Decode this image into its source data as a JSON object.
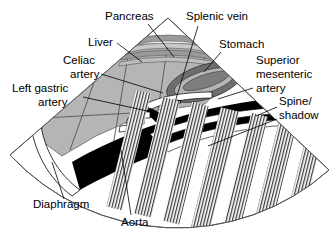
{
  "figure": {
    "kind": "anatomical-ultrasound-sector-diagram",
    "background_color": "#ffffff",
    "ink_color": "#000000",
    "palette": {
      "liver_gray": "#b5b5b5",
      "mid_gray": "#9a9a9a",
      "dark_gray": "#6e6e6e",
      "vessel_black": "#000000",
      "lumen_white": "#ffffff",
      "outline_gray": "#555555",
      "hatch_gray": "#3a3a3a"
    }
  },
  "labels": [
    {
      "id": "pancreas",
      "text": "Pancreas",
      "x": 105,
      "y": 20,
      "anchor": "start",
      "leader": "M148,24 L174,57"
    },
    {
      "id": "splenic-vein",
      "text": "Splenic vein",
      "x": 186,
      "y": 20,
      "anchor": "start",
      "leader": "M198,24 L174,101"
    },
    {
      "id": "liver",
      "text": "Liver",
      "x": 88,
      "y": 46,
      "anchor": "start",
      "leader": "M117,43 L140,62"
    },
    {
      "id": "stomach",
      "text": "Stomach",
      "x": 219,
      "y": 48,
      "anchor": "start",
      "leader": "M222,52 L203,72"
    },
    {
      "id": "celiac-artery",
      "text": "Celiac\nartery",
      "lines": [
        "Celiac",
        "artery"
      ],
      "x": 63,
      "y": 64,
      "anchor": "start",
      "leader": "M101,74 L162,92"
    },
    {
      "id": "superior-mesenteric-artery",
      "text": "Superior\nmesenteric\nartery",
      "lines": [
        "Superior",
        "mesenteric",
        "artery"
      ],
      "x": 256,
      "y": 64,
      "anchor": "start",
      "leader": "M254,88 L218,99"
    },
    {
      "id": "left-gastric-artery",
      "text": "Left gastric\nartery",
      "lines": [
        "Left gastric",
        "artery"
      ],
      "x": 12,
      "y": 92,
      "anchor": "start",
      "leader": "M83,97 L152,110"
    },
    {
      "id": "spine-shadow",
      "text": "Spine/\nshadow",
      "lines": [
        "Spine/",
        "shadow"
      ],
      "x": 279,
      "y": 105,
      "anchor": "start",
      "leader": "M277,108 L257,118",
      "leader2": "M277,120 L209,145"
    },
    {
      "id": "diaphragm",
      "text": "Diaphragm",
      "x": 33,
      "y": 208,
      "anchor": "start",
      "leader": "M64,198 L52,163"
    },
    {
      "id": "aorta",
      "text": "Aorta",
      "x": 121,
      "y": 224,
      "anchor": "start",
      "leader": "M132,214 L121,151"
    }
  ],
  "structures": [
    {
      "id": "sector-field",
      "name": "ultrasound sector field",
      "color": "#ffffff"
    },
    {
      "id": "liver-region",
      "name": "Liver parenchyma",
      "color": "#b5b5b5"
    },
    {
      "id": "pancreas-band",
      "name": "Pancreas layered bands",
      "color": "#9a9a9a"
    },
    {
      "id": "stomach-ring",
      "name": "Stomach wall ring",
      "color": "#6e6e6e"
    },
    {
      "id": "aorta-vessel",
      "name": "Aorta black band",
      "color": "#000000"
    },
    {
      "id": "splenic-vein-vessel",
      "name": "Splenic vein lumen",
      "color": "#000000"
    },
    {
      "id": "celiac-artery-vessel",
      "name": "Celiac artery branch",
      "color": "#000000"
    },
    {
      "id": "left-gastric-artery-vessel",
      "name": "Left gastric artery branch",
      "color": "#000000"
    },
    {
      "id": "sma-vessel",
      "name": "Superior mesenteric artery",
      "color": "#000000"
    },
    {
      "id": "diaphragm-band",
      "name": "Diaphragm thin white band",
      "color": "#ffffff"
    },
    {
      "id": "spine-shadow-region",
      "name": "Spine acoustic shadow hatching",
      "color": "#3a3a3a"
    }
  ]
}
